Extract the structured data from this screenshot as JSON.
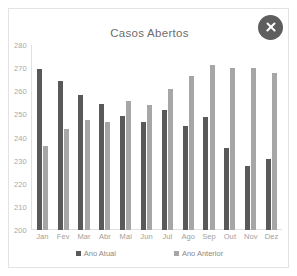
{
  "card": {
    "close_label": "×"
  },
  "chart_data": {
    "type": "bar",
    "title": "Casos Abertos",
    "xlabel": "",
    "ylabel": "",
    "ylim": [
      200,
      280
    ],
    "ytick_step": 10,
    "yticks": [
      280,
      270,
      260,
      250,
      240,
      230,
      220,
      210,
      200
    ],
    "grid": false,
    "legend_position": "bottom",
    "categories": [
      "Jan",
      "Fev",
      "Mar",
      "Abr",
      "Mai",
      "Jun",
      "Jul",
      "Ago",
      "Sep",
      "Out",
      "Nov",
      "Dez"
    ],
    "series": [
      {
        "name": "Ano Atual",
        "color": "#595959",
        "values": [
          269.5,
          264.5,
          258.5,
          254.5,
          249.5,
          246.5,
          252.0,
          245.0,
          249.0,
          235.5,
          227.5,
          230.5
        ]
      },
      {
        "name": "Ano Anterior",
        "color": "#a6a6a6",
        "values": [
          236.5,
          243.5,
          247.5,
          246.5,
          256.0,
          254.0,
          261.0,
          266.5,
          271.5,
          270.0,
          270.0,
          268.0
        ]
      }
    ]
  }
}
